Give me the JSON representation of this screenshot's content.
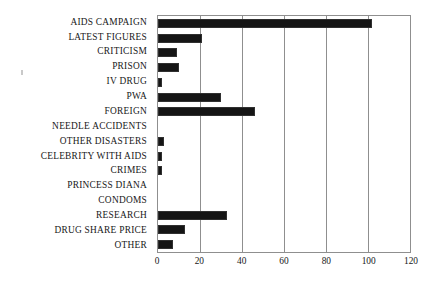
{
  "chart_data": {
    "type": "bar",
    "orientation": "horizontal",
    "title": "",
    "xlabel": "",
    "ylabel": "",
    "xlim": [
      0,
      120
    ],
    "ylim": null,
    "grid": true,
    "legend": null,
    "xticks": [
      0,
      20,
      40,
      60,
      80,
      100,
      120
    ],
    "xtick_labels": [
      "0",
      "20",
      "40",
      "60",
      "80",
      "100",
      "120"
    ],
    "categories": [
      "AIDS CAMPAIGN",
      "LATEST FIGURES",
      "CRITICISM",
      "PRISON",
      "IV DRUG",
      "PWA",
      "FOREIGN",
      "NEEDLE ACCIDENTS",
      "OTHER DISASTERS",
      "CELEBRITY WITH AIDS",
      "CRIMES",
      "PRINCESS DIANA",
      "CONDOMS",
      "RESEARCH",
      "DRUG SHARE PRICE",
      "OTHER"
    ],
    "values": [
      102,
      21,
      9,
      10,
      2,
      30,
      46,
      0,
      3,
      2,
      2,
      0,
      0,
      33,
      13,
      7
    ],
    "bar_color": "#151515",
    "frame_color": "#8f8f8f",
    "background_color": "#ffffff"
  }
}
